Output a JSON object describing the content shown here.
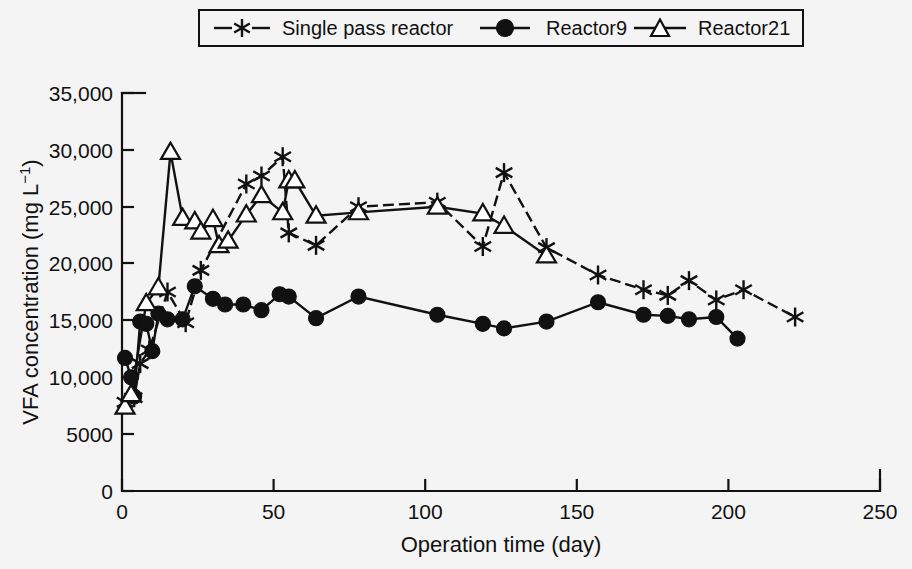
{
  "figure": {
    "background_color": "#f4f4f4",
    "foreground_color": "#111111"
  },
  "legend": {
    "position": "top-center",
    "border": true,
    "entries": [
      {
        "label": "Single pass reactor",
        "marker": "star-icon",
        "line_style": "dashed"
      },
      {
        "label": "Reactor9",
        "marker": "filled-circle-icon",
        "line_style": "solid"
      },
      {
        "label": "Reactor21",
        "marker": "open-triangle-icon",
        "line_style": "solid"
      }
    ]
  },
  "axes": {
    "x_title": "Operation time (day)",
    "y_title_main": "VFA concentration (mg L",
    "y_title_exponent": "−1",
    "y_title_close": ")",
    "y_title_full": "VFA concentration (mg L−1)",
    "x_ticks": [
      "0",
      "50",
      "100",
      "150",
      "200",
      "250"
    ],
    "y_ticks": [
      "0",
      "5000",
      "10,000",
      "15,000",
      "20,000",
      "25,000",
      "30,000",
      "35,000"
    ]
  },
  "chart_data": {
    "type": "line",
    "title": "",
    "xlabel": "Operation time (day)",
    "ylabel": "VFA concentration (mg L−1)",
    "xlim": [
      0,
      250
    ],
    "ylim": [
      0,
      35000
    ],
    "xticks": [
      0,
      50,
      100,
      150,
      200,
      250
    ],
    "yticks": [
      0,
      5000,
      10000,
      15000,
      20000,
      25000,
      30000,
      35000
    ],
    "grid": false,
    "legend_position": "top-center",
    "series": [
      {
        "name": "Single pass reactor",
        "marker": "star",
        "line_style": "dashed",
        "color": "#111111",
        "points": [
          [
            1,
            7800
          ],
          [
            4,
            8200
          ],
          [
            6,
            11200
          ],
          [
            9,
            12400
          ],
          [
            15,
            17500
          ],
          [
            21,
            14800
          ],
          [
            26,
            19400
          ],
          [
            41,
            27000
          ],
          [
            46,
            27700
          ],
          [
            53,
            29400
          ],
          [
            55,
            22700
          ],
          [
            64,
            21600
          ],
          [
            78,
            25000
          ],
          [
            104,
            25400
          ],
          [
            119,
            21500
          ],
          [
            126,
            28000
          ],
          [
            140,
            21400
          ],
          [
            157,
            19000
          ],
          [
            172,
            17700
          ],
          [
            180,
            17200
          ],
          [
            187,
            18500
          ],
          [
            196,
            16800
          ],
          [
            205,
            17700
          ],
          [
            222,
            15300
          ]
        ]
      },
      {
        "name": "Reactor9",
        "marker": "filled-circle",
        "line_style": "solid",
        "color": "#111111",
        "points": [
          [
            1,
            11700
          ],
          [
            3,
            10000
          ],
          [
            4,
            8300
          ],
          [
            6,
            14900
          ],
          [
            8,
            14700
          ],
          [
            10,
            12300
          ],
          [
            12,
            15600
          ],
          [
            15,
            15100
          ],
          [
            20,
            15100
          ],
          [
            24,
            18000
          ],
          [
            30,
            16900
          ],
          [
            34,
            16400
          ],
          [
            40,
            16400
          ],
          [
            46,
            15900
          ],
          [
            52,
            17300
          ],
          [
            55,
            17100
          ],
          [
            64,
            15200
          ],
          [
            78,
            17100
          ],
          [
            104,
            15500
          ],
          [
            119,
            14700
          ],
          [
            126,
            14300
          ],
          [
            140,
            14900
          ],
          [
            157,
            16600
          ],
          [
            172,
            15500
          ],
          [
            180,
            15400
          ],
          [
            187,
            15100
          ],
          [
            196,
            15300
          ],
          [
            203,
            13400
          ]
        ]
      },
      {
        "name": "Reactor21",
        "marker": "open-triangle",
        "line_style": "solid",
        "color": "#111111",
        "points": [
          [
            1,
            7400
          ],
          [
            3,
            8500
          ],
          [
            8,
            16500
          ],
          [
            12,
            17900
          ],
          [
            16,
            29800
          ],
          [
            20,
            24000
          ],
          [
            24,
            23700
          ],
          [
            26,
            22800
          ],
          [
            30,
            23900
          ],
          [
            32,
            21600
          ],
          [
            35,
            22000
          ],
          [
            41,
            24300
          ],
          [
            46,
            26000
          ],
          [
            53,
            24500
          ],
          [
            55,
            27300
          ],
          [
            57,
            27300
          ],
          [
            64,
            24200
          ],
          [
            78,
            24500
          ],
          [
            104,
            25000
          ],
          [
            119,
            24400
          ],
          [
            126,
            23300
          ],
          [
            140,
            20700
          ]
        ]
      }
    ]
  }
}
